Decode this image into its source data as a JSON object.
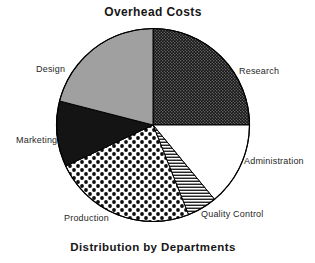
{
  "page": {
    "background": "#ffffff",
    "ink_color": "#1a1a1a"
  },
  "chart_data": {
    "type": "pie",
    "title": "Overhead Costs",
    "caption": "Distribution by Departments",
    "legend": "none",
    "values_shown_on_chart": false,
    "values_estimated_from_angles_percent": true,
    "direction": "clockwise",
    "start_angle_deg_from_north": 0,
    "slices": [
      {
        "label": "Research",
        "value": 25,
        "pattern": "fine-white-dots-on-black"
      },
      {
        "label": "Administration",
        "value": 14,
        "pattern": "solid-white"
      },
      {
        "label": "Quality Control",
        "value": 5,
        "pattern": "horizontal-stripes"
      },
      {
        "label": "Production",
        "value": 24,
        "pattern": "black-polka-dots-on-white"
      },
      {
        "label": "Marketing",
        "value": 11,
        "pattern": "solid-black"
      },
      {
        "label": "Design",
        "value": 21,
        "pattern": "solid-gray"
      }
    ],
    "colors": {
      "slice_gray": "#a0a0a0",
      "slice_black": "#141414",
      "slice_white": "#ffffff",
      "pattern_ink": "#000000",
      "outline": "#000000"
    }
  }
}
